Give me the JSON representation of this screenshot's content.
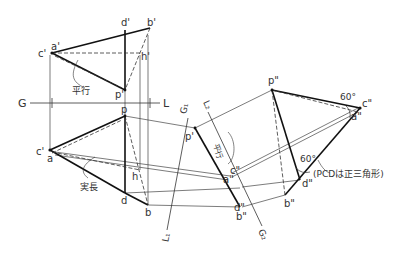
{
  "diagram": {
    "ground_line": {
      "left": "G",
      "right": "L"
    },
    "aux_line_1": {
      "top": "G1",
      "bottom": "L1"
    },
    "aux_line_2": {
      "top": "L2",
      "bottom": "G2"
    },
    "labels": {
      "c_prime": "c'",
      "a_prime": "a'",
      "d_prime": "d'",
      "b_prime": "b'",
      "h_prime": "h'",
      "p_prime": "p'",
      "p": "p",
      "c": "c'",
      "a": "a",
      "d": "d",
      "b": "b",
      "h": "h",
      "p_aux1": "p'",
      "c_aux1": "c\"",
      "a_aux1": "a\"",
      "d_aux1": "d\"",
      "b_aux1": "b\"",
      "p_aux2": "p\"",
      "c_aux2": "c\"",
      "a_aux2": "a\"",
      "d_aux2": "d\"",
      "b_aux2": "b\""
    },
    "annotations": {
      "parallel_1": "平行",
      "parallel_2": "平行",
      "true_length": "実長",
      "angle_1": "60°",
      "angle_2": "60°",
      "note": "(PCDは正三角形)"
    },
    "colors": {
      "line": "#222222",
      "thin": "#444444",
      "text": "#333333"
    }
  }
}
